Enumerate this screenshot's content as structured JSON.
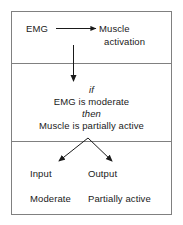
{
  "diagram": {
    "panels": {
      "top": {
        "source_label": "EMG",
        "target_label_line1": "Muscle",
        "target_label_line2": "activation",
        "arrow_name": "emg-to-muscle-arrow"
      },
      "middle": {
        "if_keyword": "if",
        "premise": "EMG is moderate",
        "then_keyword": "then",
        "conclusion": "Muscle is partially active",
        "arrow_name": "down-arrow"
      },
      "bottom": {
        "input_header": "Input",
        "output_header": "Output",
        "input_value": "Moderate",
        "output_value": "Partially active",
        "arrow_name": "branch-arrows"
      }
    },
    "colors": {
      "border": "#808080",
      "text": "#1a1a1a",
      "arrow": "#1a1a1a",
      "background": "#ffffff"
    }
  }
}
